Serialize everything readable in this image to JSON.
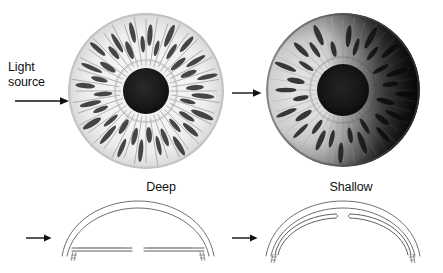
{
  "figure": {
    "background_color": "#ffffff",
    "width": 443,
    "height": 273
  },
  "annotations": {
    "light_source_line1": "Light",
    "light_source_line2": "source"
  },
  "panels": {
    "left": {
      "caption": "Deep",
      "condition": "deep-anterior-chamber",
      "iris_illumination": "iris fully and evenly illuminated, no shadow",
      "iris_description": "light-colored iris with radial crypts and stromal fibers, uniformly lit across its whole width",
      "pupil_color": "#1a1a1a",
      "cross_section": {
        "iris_profile": "flat",
        "chamber_depth": "deep",
        "angle": "wide open"
      }
    },
    "right": {
      "caption": "Shallow",
      "condition": "shallow-anterior-chamber",
      "iris_illumination": "crescent shadow on far side of iris (eclipse sign)",
      "iris_description": "iris lit on the near side with a dark crescent of shadow over the distal half, indicating forward iris bowing",
      "pupil_color": "#141414",
      "cross_section": {
        "iris_profile": "convex / bowed forward",
        "chamber_depth": "shallow",
        "angle": "narrow"
      }
    }
  },
  "icons": {
    "light_arrow": "arrow-right-icon",
    "section_arrow": "arrow-right-icon"
  },
  "colors": {
    "ink": "#111111",
    "line": "#6b6b6b",
    "shadow": "#101010",
    "highlight": "#f2f2f2"
  }
}
